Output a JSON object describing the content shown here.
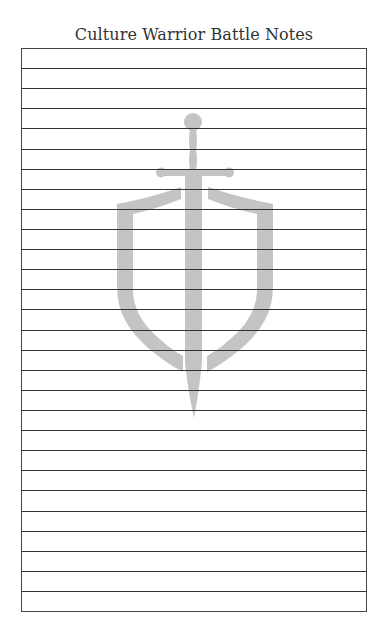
{
  "page": {
    "title": "Culture Warrior Battle Notes"
  },
  "notes_sheet": {
    "row_count": 28,
    "line_color": "#333333",
    "rows": [
      "",
      "",
      "",
      "",
      "",
      "",
      "",
      "",
      "",
      "",
      "",
      "",
      "",
      "",
      "",
      "",
      "",
      "",
      "",
      "",
      "",
      "",
      "",
      "",
      "",
      "",
      "",
      ""
    ]
  },
  "watermark": {
    "icon": "sword-and-shield-icon",
    "color": "#c4c4c4"
  }
}
